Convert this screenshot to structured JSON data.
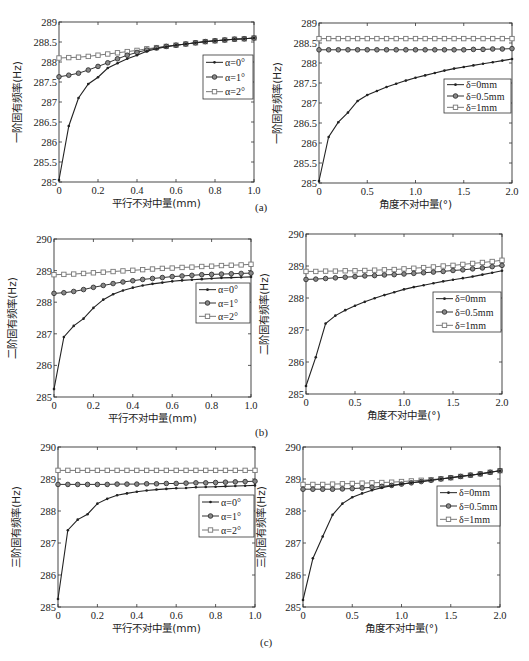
{
  "figure": {
    "panel_labels": [
      "(a)",
      "(b)",
      "(c)"
    ]
  },
  "chart_data": [
    {
      "id": "a-left",
      "panel": "(a)",
      "type": "line",
      "title": "",
      "xlabel": "平行不对中量(mm)",
      "ylabel": "一阶固有频率(Hz)",
      "xlim": [
        0,
        1.0
      ],
      "ylim": [
        285,
        289
      ],
      "xticks": [
        0,
        0.2,
        0.4,
        0.6,
        0.8,
        1.0
      ],
      "xtick_labels": [
        "0",
        "0.2",
        "0.4",
        "0.6",
        "0.8",
        "1.0"
      ],
      "yticks": [
        285,
        285.5,
        286,
        286.5,
        287,
        287.5,
        288,
        288.5,
        289
      ],
      "ytick_labels": [
        "285",
        "285.5",
        "286",
        "286.5",
        "287",
        "287.5",
        "288",
        "288.5",
        "289"
      ],
      "grid": false,
      "legend_position": "upper right (inside)",
      "x": [
        0,
        0.05,
        0.1,
        0.15,
        0.2,
        0.25,
        0.3,
        0.35,
        0.4,
        0.45,
        0.5,
        0.55,
        0.6,
        0.65,
        0.7,
        0.75,
        0.8,
        0.85,
        0.9,
        0.95,
        1.0
      ],
      "series": [
        {
          "name": "α=0°",
          "marker": "dot",
          "color": "#222222",
          "values": [
            285.05,
            286.4,
            287.1,
            287.45,
            287.62,
            287.85,
            287.97,
            288.08,
            288.17,
            288.27,
            288.33,
            288.38,
            288.42,
            288.45,
            288.48,
            288.51,
            288.53,
            288.55,
            288.57,
            288.58,
            288.6
          ]
        },
        {
          "name": "α=1°",
          "marker": "circle",
          "color": "#333333",
          "values": [
            287.63,
            287.67,
            287.72,
            287.8,
            287.89,
            287.98,
            288.08,
            288.17,
            288.24,
            288.3,
            288.35,
            288.39,
            288.42,
            288.45,
            288.48,
            288.51,
            288.53,
            288.55,
            288.57,
            288.58,
            288.6
          ]
        },
        {
          "name": "α=2°",
          "marker": "square",
          "color": "#777777",
          "values": [
            288.1,
            288.11,
            288.12,
            288.14,
            288.17,
            288.2,
            288.23,
            288.26,
            288.29,
            288.33,
            288.36,
            288.39,
            288.42,
            288.45,
            288.48,
            288.51,
            288.53,
            288.55,
            288.57,
            288.58,
            288.6
          ]
        }
      ]
    },
    {
      "id": "a-right",
      "panel": "(a)",
      "type": "line",
      "title": "",
      "xlabel": "角度不对中量(°)",
      "ylabel": "一阶固有频率(Hz)",
      "xlim": [
        0,
        2.0
      ],
      "ylim": [
        285,
        289
      ],
      "xticks": [
        0,
        0.5,
        1.0,
        1.5,
        2.0
      ],
      "xtick_labels": [
        "0",
        "0.5",
        "1.0",
        "1.5",
        "2.0"
      ],
      "yticks": [
        285,
        285.5,
        286,
        286.5,
        287,
        287.5,
        288,
        288.5,
        289
      ],
      "ytick_labels": [
        "285",
        "285.5",
        "286",
        "286.5",
        "287",
        "287.5",
        "288",
        "288.5",
        "289"
      ],
      "grid": false,
      "legend_position": "right (inside, middle)",
      "x": [
        0,
        0.1,
        0.2,
        0.3,
        0.4,
        0.5,
        0.6,
        0.7,
        0.8,
        0.9,
        1.0,
        1.1,
        1.2,
        1.3,
        1.4,
        1.5,
        1.6,
        1.7,
        1.8,
        1.9,
        2.0
      ],
      "series": [
        {
          "name": "δ=0mm",
          "marker": "dot",
          "color": "#222222",
          "values": [
            285.05,
            286.15,
            286.52,
            286.76,
            287.05,
            287.2,
            287.3,
            287.4,
            287.48,
            287.56,
            287.63,
            287.69,
            287.75,
            287.81,
            287.86,
            287.9,
            287.94,
            287.98,
            288.02,
            288.06,
            288.1
          ]
        },
        {
          "name": "δ=0.5mm",
          "marker": "circle",
          "color": "#333333",
          "values": [
            288.33,
            288.33,
            288.33,
            288.33,
            288.33,
            288.33,
            288.33,
            288.33,
            288.33,
            288.33,
            288.33,
            288.33,
            288.33,
            288.33,
            288.33,
            288.33,
            288.34,
            288.34,
            288.35,
            288.35,
            288.36
          ]
        },
        {
          "name": "δ=1mm",
          "marker": "square",
          "color": "#777777",
          "values": [
            288.61,
            288.61,
            288.61,
            288.61,
            288.61,
            288.61,
            288.61,
            288.61,
            288.61,
            288.61,
            288.61,
            288.61,
            288.61,
            288.61,
            288.61,
            288.61,
            288.61,
            288.61,
            288.61,
            288.61,
            288.61
          ]
        }
      ]
    },
    {
      "id": "b-left",
      "panel": "(b)",
      "type": "line",
      "title": "",
      "xlabel": "平行不对中量(mm)",
      "ylabel": "二阶固有频率(Hz)",
      "xlim": [
        0,
        1.0
      ],
      "ylim": [
        285,
        290
      ],
      "xticks": [
        0,
        0.2,
        0.4,
        0.6,
        0.8,
        1.0
      ],
      "xtick_labels": [
        "0",
        "0.2",
        "0.4",
        "0.6",
        "0.8",
        "1.0"
      ],
      "yticks": [
        285,
        286,
        287,
        288,
        289,
        290
      ],
      "ytick_labels": [
        "285",
        "286",
        "287",
        "288",
        "289",
        "290"
      ],
      "grid": false,
      "legend_position": "right (inside, upper-middle)",
      "x": [
        0,
        0.05,
        0.1,
        0.15,
        0.2,
        0.25,
        0.3,
        0.35,
        0.4,
        0.45,
        0.5,
        0.55,
        0.6,
        0.65,
        0.7,
        0.75,
        0.8,
        0.85,
        0.9,
        0.95,
        1.0
      ],
      "series": [
        {
          "name": "α=0°",
          "marker": "dot",
          "color": "#222222",
          "values": [
            285.25,
            286.9,
            287.25,
            287.48,
            287.82,
            288.08,
            288.25,
            288.37,
            288.46,
            288.53,
            288.58,
            288.62,
            288.66,
            288.69,
            288.71,
            288.73,
            288.75,
            288.77,
            288.78,
            288.79,
            288.8
          ]
        },
        {
          "name": "α=1°",
          "marker": "circle",
          "color": "#333333",
          "values": [
            288.28,
            288.3,
            288.34,
            288.4,
            288.47,
            288.53,
            288.59,
            288.64,
            288.68,
            288.72,
            288.75,
            288.78,
            288.81,
            288.83,
            288.85,
            288.87,
            288.88,
            288.89,
            288.9,
            288.91,
            288.92
          ]
        },
        {
          "name": "α=2°",
          "marker": "square",
          "color": "#777777",
          "values": [
            288.87,
            288.88,
            288.89,
            288.91,
            288.93,
            288.95,
            288.97,
            288.99,
            289.01,
            289.03,
            289.05,
            289.07,
            289.08,
            289.1,
            289.11,
            289.13,
            289.14,
            289.16,
            289.17,
            289.18,
            289.2
          ]
        }
      ]
    },
    {
      "id": "b-right",
      "panel": "(b)",
      "type": "line",
      "title": "",
      "xlabel": "角度不对中量(°)",
      "ylabel": "二阶固有频率(Hz)",
      "xlim": [
        0,
        2.0
      ],
      "ylim": [
        285,
        290
      ],
      "xticks": [
        0,
        0.5,
        1.0,
        1.5,
        2.0
      ],
      "xtick_labels": [
        "0",
        "0.5",
        "1.0",
        "1.5",
        "2.0"
      ],
      "yticks": [
        285,
        286,
        287,
        288,
        289,
        290
      ],
      "ytick_labels": [
        "285",
        "286",
        "287",
        "288",
        "289",
        "290"
      ],
      "grid": false,
      "legend_position": "right (inside, middle)",
      "x": [
        0,
        0.1,
        0.2,
        0.3,
        0.4,
        0.5,
        0.6,
        0.7,
        0.8,
        0.9,
        1.0,
        1.1,
        1.2,
        1.3,
        1.4,
        1.5,
        1.6,
        1.7,
        1.8,
        1.9,
        2.0
      ],
      "series": [
        {
          "name": "δ=0mm",
          "marker": "dot",
          "color": "#222222",
          "values": [
            285.25,
            286.15,
            287.2,
            287.45,
            287.62,
            287.76,
            287.88,
            287.99,
            288.09,
            288.18,
            288.27,
            288.34,
            288.4,
            288.46,
            288.52,
            288.57,
            288.62,
            288.67,
            288.73,
            288.79,
            288.85
          ]
        },
        {
          "name": "δ=0.5mm",
          "marker": "circle",
          "color": "#333333",
          "values": [
            288.58,
            288.59,
            288.61,
            288.63,
            288.65,
            288.67,
            288.69,
            288.7,
            288.72,
            288.73,
            288.75,
            288.77,
            288.79,
            288.81,
            288.83,
            288.86,
            288.88,
            288.91,
            288.94,
            288.98,
            289.02
          ]
        },
        {
          "name": "δ=1mm",
          "marker": "square",
          "color": "#777777",
          "values": [
            288.83,
            288.83,
            288.84,
            288.84,
            288.85,
            288.85,
            288.86,
            288.87,
            288.88,
            288.89,
            288.91,
            288.93,
            288.95,
            288.97,
            289.0,
            289.02,
            289.05,
            289.08,
            289.11,
            289.14,
            289.18
          ]
        }
      ]
    },
    {
      "id": "c-left",
      "panel": "(c)",
      "type": "line",
      "title": "",
      "xlabel": "平行不对中量(mm)",
      "ylabel": "三阶固有频率(Hz)",
      "xlim": [
        0,
        1.0
      ],
      "ylim": [
        285,
        290
      ],
      "xticks": [
        0,
        0.2,
        0.4,
        0.6,
        0.8,
        1.0
      ],
      "xtick_labels": [
        "0",
        "0.2",
        "0.4",
        "0.6",
        "0.8",
        "1.0"
      ],
      "yticks": [
        285,
        286,
        287,
        288,
        289,
        290
      ],
      "ytick_labels": [
        "285",
        "286",
        "287",
        "288",
        "289",
        "290"
      ],
      "grid": false,
      "legend_position": "right (inside, upper-middle)",
      "x": [
        0,
        0.05,
        0.1,
        0.15,
        0.2,
        0.25,
        0.3,
        0.35,
        0.4,
        0.45,
        0.5,
        0.55,
        0.6,
        0.65,
        0.7,
        0.75,
        0.8,
        0.85,
        0.9,
        0.95,
        1.0
      ],
      "series": [
        {
          "name": "α=0°",
          "marker": "dot",
          "color": "#222222",
          "values": [
            285.25,
            287.4,
            287.73,
            287.9,
            288.23,
            288.38,
            288.49,
            288.55,
            288.6,
            288.64,
            288.67,
            288.69,
            288.71,
            288.72,
            288.74,
            288.75,
            288.76,
            288.77,
            288.78,
            288.79,
            288.8
          ]
        },
        {
          "name": "α=1°",
          "marker": "circle",
          "color": "#333333",
          "values": [
            288.83,
            288.83,
            288.83,
            288.83,
            288.83,
            288.83,
            288.84,
            288.84,
            288.84,
            288.85,
            288.85,
            288.86,
            288.86,
            288.87,
            288.88,
            288.88,
            288.89,
            288.9,
            288.91,
            288.92,
            288.93
          ]
        },
        {
          "name": "α=2°",
          "marker": "square",
          "color": "#777777",
          "values": [
            289.27,
            289.27,
            289.27,
            289.27,
            289.27,
            289.27,
            289.27,
            289.27,
            289.27,
            289.27,
            289.27,
            289.27,
            289.27,
            289.27,
            289.27,
            289.27,
            289.27,
            289.27,
            289.27,
            289.27,
            289.27
          ]
        }
      ]
    },
    {
      "id": "c-right",
      "panel": "(c)",
      "type": "line",
      "title": "",
      "xlabel": "角度不对中量(°)",
      "ylabel": "三阶固有频率(Hz)",
      "xlim": [
        0,
        2.0
      ],
      "ylim": [
        285,
        290
      ],
      "xticks": [
        0,
        0.5,
        1.0,
        1.5,
        2.0
      ],
      "xtick_labels": [
        "0",
        "0.5",
        "1.0",
        "1.5",
        "2.0"
      ],
      "yticks": [
        285,
        286,
        287,
        288,
        289,
        290
      ],
      "ytick_labels": [
        "285",
        "286",
        "287",
        "288",
        "289",
        "290"
      ],
      "grid": false,
      "legend_position": "upper right (inside)",
      "x": [
        0,
        0.1,
        0.2,
        0.3,
        0.4,
        0.5,
        0.6,
        0.7,
        0.8,
        0.9,
        1.0,
        1.1,
        1.2,
        1.3,
        1.4,
        1.5,
        1.6,
        1.7,
        1.8,
        1.9,
        2.0
      ],
      "series": [
        {
          "name": "δ=0mm",
          "marker": "dot",
          "color": "#222222",
          "values": [
            285.22,
            286.52,
            287.2,
            287.88,
            288.23,
            288.43,
            288.55,
            288.65,
            288.73,
            288.79,
            288.84,
            288.88,
            288.92,
            288.96,
            289.0,
            289.04,
            289.08,
            289.12,
            289.16,
            289.21,
            289.26
          ]
        },
        {
          "name": "δ=0.5mm",
          "marker": "circle",
          "color": "#333333",
          "values": [
            288.68,
            288.68,
            288.68,
            288.68,
            288.69,
            288.7,
            288.72,
            288.74,
            288.77,
            288.8,
            288.84,
            288.88,
            288.92,
            288.96,
            289.0,
            289.04,
            289.08,
            289.12,
            289.16,
            289.21,
            289.26
          ]
        },
        {
          "name": "δ=1mm",
          "marker": "square",
          "color": "#777777",
          "values": [
            288.83,
            288.83,
            288.83,
            288.84,
            288.85,
            288.86,
            288.87,
            288.88,
            288.89,
            288.9,
            288.92,
            288.94,
            288.96,
            288.98,
            289.01,
            289.04,
            289.08,
            289.12,
            289.16,
            289.21,
            289.26
          ]
        }
      ]
    }
  ]
}
